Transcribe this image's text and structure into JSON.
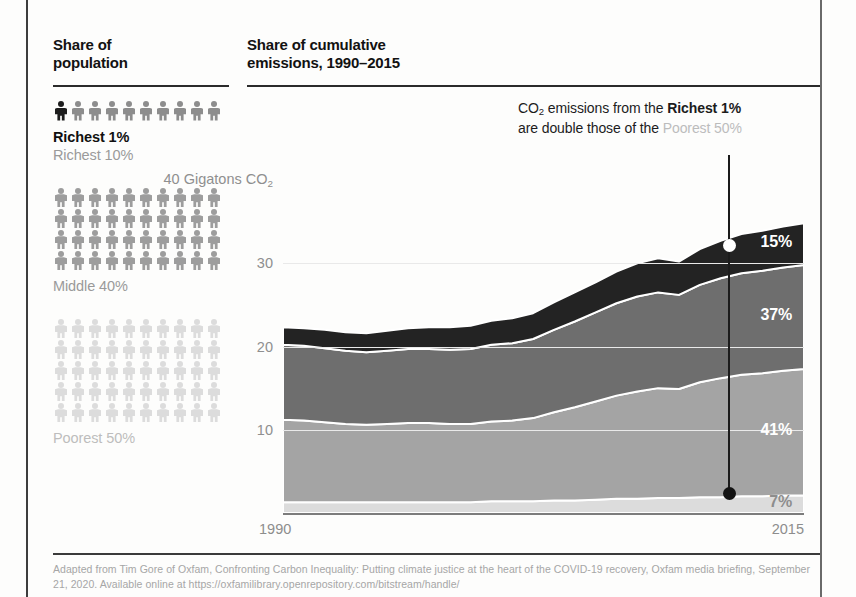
{
  "left_panel": {
    "title": "Share of\npopulation",
    "title_line1": "Share of",
    "title_line2": "population",
    "groups": [
      {
        "key": "richest1",
        "rows": 1,
        "per_row": 10,
        "highlight_first": true,
        "labels": [
          {
            "text": "Richest 1%",
            "style": "bold"
          },
          {
            "text": "Richest 10%",
            "style": "muted"
          }
        ]
      },
      {
        "key": "middle40",
        "rows": 4,
        "per_row": 10,
        "highlight_first": false,
        "labels": [
          {
            "text": "Middle 40%",
            "style": "muted"
          }
        ]
      },
      {
        "key": "poorest50",
        "rows": 5,
        "per_row": 10,
        "highlight_first": false,
        "labels": [
          {
            "text": "Poorest 50%",
            "style": "vlight"
          }
        ]
      }
    ]
  },
  "chart_panel": {
    "title_line1": "Share of cumulative",
    "title_line2": "emissions, 1990–2015",
    "callout": {
      "prefix": "CO",
      "sub": "2",
      "part1": " emissions from the ",
      "strong": "Richest 1%",
      "part2": "are double those of the ",
      "faint": "Poorest 50%"
    }
  },
  "chart_data": {
    "type": "area",
    "stacked": true,
    "title": "Share of cumulative emissions, 1990–2015",
    "xlabel": "",
    "ylabel": "40 Gigatons CO2",
    "xlim": [
      1990,
      2015
    ],
    "ylim": [
      0,
      40
    ],
    "grid": true,
    "legend_position": "none",
    "y_ticks": [
      "40 Gigatons CO",
      "30",
      "20",
      "10"
    ],
    "y_tick_top_sub": "2",
    "y_tick_values": [
      40,
      30,
      20,
      10
    ],
    "x_ticks": [
      "1990",
      "2015"
    ],
    "x": [
      1990,
      1991,
      1992,
      1993,
      1994,
      1995,
      1996,
      1997,
      1998,
      1999,
      2000,
      2001,
      2002,
      2003,
      2004,
      2005,
      2006,
      2007,
      2008,
      2009,
      2010,
      2011,
      2012,
      2013,
      2014,
      2015
    ],
    "series": [
      {
        "name": "Poorest 50%",
        "color": "#dcdcdc",
        "end_share_label": "7%",
        "values": [
          1.3,
          1.3,
          1.3,
          1.3,
          1.3,
          1.3,
          1.3,
          1.3,
          1.3,
          1.3,
          1.4,
          1.4,
          1.4,
          1.5,
          1.5,
          1.6,
          1.7,
          1.7,
          1.8,
          1.8,
          1.9,
          1.9,
          2.0,
          2.0,
          2.1,
          2.1
        ]
      },
      {
        "name": "Middle 40%",
        "color": "#a4a4a4",
        "end_share_label": "41%",
        "values": [
          9.9,
          9.8,
          9.6,
          9.4,
          9.3,
          9.4,
          9.5,
          9.5,
          9.4,
          9.4,
          9.6,
          9.7,
          10.0,
          10.6,
          11.2,
          11.8,
          12.4,
          12.9,
          13.2,
          13.1,
          13.8,
          14.3,
          14.6,
          14.8,
          15.0,
          15.2
        ]
      },
      {
        "name": "Richest 10%",
        "color": "#6e6e6e",
        "end_share_label": "37%",
        "values": [
          9.0,
          9.0,
          8.9,
          8.8,
          8.7,
          8.8,
          8.9,
          8.9,
          8.9,
          9.0,
          9.2,
          9.3,
          9.5,
          9.9,
          10.3,
          10.7,
          11.1,
          11.4,
          11.5,
          11.3,
          11.7,
          12.0,
          12.2,
          12.3,
          12.4,
          12.5
        ]
      },
      {
        "name": "Richest 1%",
        "color": "#232323",
        "end_share_label": "15%",
        "values": [
          2.1,
          2.1,
          2.2,
          2.2,
          2.3,
          2.4,
          2.5,
          2.6,
          2.7,
          2.8,
          2.9,
          3.0,
          3.1,
          3.3,
          3.5,
          3.6,
          3.8,
          4.0,
          4.1,
          4.0,
          4.3,
          4.5,
          4.7,
          4.8,
          4.9,
          5.0
        ]
      }
    ],
    "annotations": [
      {
        "text": "15%",
        "series": "Richest 1%",
        "at_x": 2015
      },
      {
        "text": "37%",
        "series": "Richest 10%",
        "at_x": 2015
      },
      {
        "text": "41%",
        "series": "Middle 40%",
        "at_x": 2015
      },
      {
        "text": "7%",
        "series": "Poorest 50%",
        "at_x": 2015
      }
    ]
  },
  "footnote": {
    "line1": "Adapted from Tim Gore of Oxfam, Confronting Carbon Inequality: Putting climate justice at the heart of the COVID-19 recovery,",
    "line2": "Oxfam media briefing, September 21, 2020. Available online at https://oxfamilibrary.openrepository.com/bitstream/handle/"
  }
}
